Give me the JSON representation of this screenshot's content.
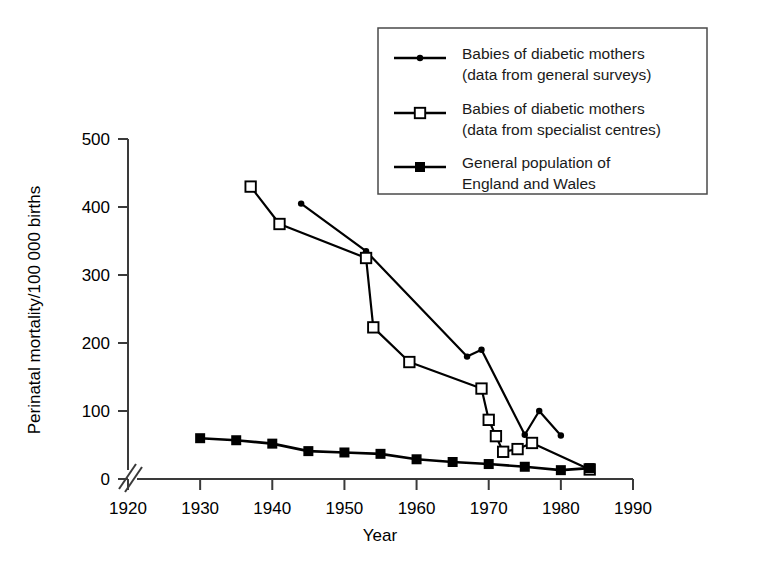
{
  "chart_data": {
    "type": "line",
    "title": "",
    "xlabel": "Year",
    "ylabel": "Perinatal mortality/100 000 births",
    "xlim": [
      1920,
      1990
    ],
    "ylim": [
      0,
      500
    ],
    "xticks": [
      1920,
      1930,
      1940,
      1950,
      1960,
      1970,
      1980,
      1990
    ],
    "yticks": [
      0,
      100,
      200,
      300,
      400,
      500
    ],
    "grid": false,
    "axis_break": true,
    "axis_break_note": "double slash break on axes at origin",
    "legend_position": "top-right",
    "series": [
      {
        "name": "Babies of diabetic mothers (data from general surveys)",
        "marker": "filled-circle",
        "color": "#000000",
        "x": [
          1944,
          1953,
          1967,
          1969,
          1975,
          1977,
          1980
        ],
        "y": [
          405,
          335,
          180,
          190,
          65,
          100,
          64
        ]
      },
      {
        "name": "Babies of diabetic mothers (data from specialist centres)",
        "marker": "open-square",
        "color": "#000000",
        "x": [
          1937,
          1941,
          1953,
          1954,
          1959,
          1969,
          1970,
          1971,
          1972,
          1974,
          1976,
          1984
        ],
        "y": [
          430,
          375,
          325,
          223,
          172,
          133,
          87,
          63,
          40,
          44,
          53,
          14
        ]
      },
      {
        "name": "General population of England and Wales",
        "marker": "filled-square",
        "color": "#000000",
        "x": [
          1930,
          1935,
          1940,
          1945,
          1950,
          1955,
          1960,
          1965,
          1970,
          1975,
          1980,
          1984
        ],
        "y": [
          60,
          57,
          52,
          41,
          39,
          37,
          29,
          25,
          22,
          18,
          13,
          16
        ]
      }
    ]
  },
  "legend": {
    "entries": [
      {
        "marker": "filled-circle",
        "line1": "Babies of diabetic mothers",
        "line2": "(data from general surveys)"
      },
      {
        "marker": "open-square",
        "line1": "Babies of diabetic mothers",
        "line2": "(data from specialist centres)"
      },
      {
        "marker": "filled-square",
        "line1": "General population of",
        "line2": "England and Wales"
      }
    ]
  },
  "axes": {
    "x_title": "Year",
    "y_title": "Perinatal mortality/100 000 births",
    "x_tick_labels": [
      "1920",
      "1930",
      "1940",
      "1950",
      "1960",
      "1970",
      "1980",
      "1990"
    ],
    "y_tick_labels": [
      "0",
      "100",
      "200",
      "300",
      "400",
      "500"
    ]
  },
  "colors": {
    "ink": "#000000",
    "axis": "#3a3a3a",
    "background": "#ffffff"
  }
}
